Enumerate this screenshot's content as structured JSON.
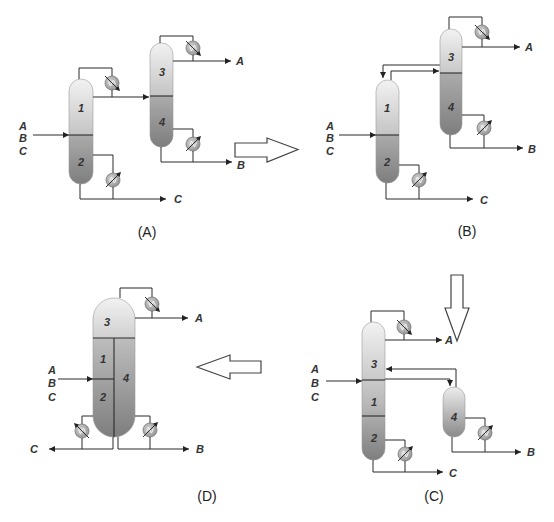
{
  "figure": {
    "panels": {
      "a": {
        "caption": "(A)",
        "feed": [
          "A",
          "B",
          "C"
        ],
        "sections": [
          "1",
          "2",
          "3",
          "4"
        ],
        "products": {
          "top": "A",
          "middle": "B",
          "bottom": "C"
        }
      },
      "b": {
        "caption": "(B)",
        "feed": [
          "A",
          "B",
          "C"
        ],
        "sections": [
          "1",
          "2",
          "3",
          "4"
        ],
        "products": {
          "top": "A",
          "middle": "B",
          "bottom": "C"
        }
      },
      "c": {
        "caption": "(C)",
        "feed": [
          "A",
          "B",
          "C"
        ],
        "sections": [
          "1",
          "2",
          "3",
          "4"
        ],
        "products": {
          "top": "A",
          "middle": "B",
          "bottom": "C"
        }
      },
      "d": {
        "caption": "(D)",
        "feed": [
          "A",
          "B",
          "C"
        ],
        "sections": [
          "1",
          "2",
          "3",
          "4"
        ],
        "products": {
          "top": "A",
          "middle": "B",
          "bottom": "C"
        }
      }
    },
    "transitions": [
      {
        "from": "A",
        "to": "B",
        "direction": "right"
      },
      {
        "from": "B",
        "to": "C",
        "direction": "down"
      },
      {
        "from": "C",
        "to": "D",
        "direction": "left"
      }
    ],
    "colors": {
      "line": "#2b2b2b",
      "column_light": "#f2f2f2",
      "column_dark": "#7e7e7e",
      "exchanger": "#a8a8a8"
    }
  }
}
